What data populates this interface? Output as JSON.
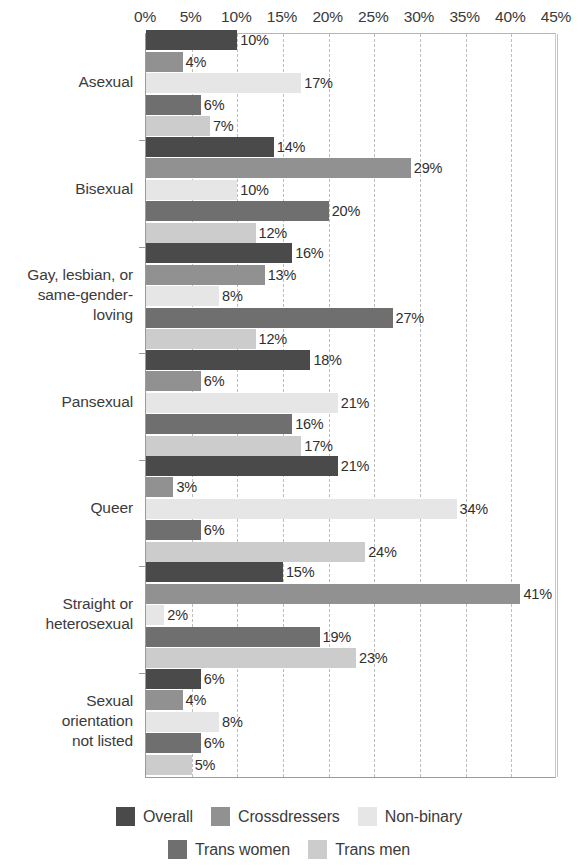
{
  "chart_data": {
    "type": "bar",
    "orientation": "horizontal",
    "title": "",
    "subtitle": "",
    "xlabel": "",
    "ylabel": "",
    "xlim": [
      0,
      45
    ],
    "xtick_labels": [
      "0%",
      "5%",
      "10%",
      "15%",
      "20%",
      "25%",
      "30%",
      "35%",
      "40%",
      "45%"
    ],
    "xticks": [
      0,
      5,
      10,
      15,
      20,
      25,
      30,
      35,
      40,
      45
    ],
    "grid": true,
    "grid_axis": "x",
    "legend_position": "bottom",
    "value_label_suffix": "%",
    "categories": [
      "Asexual",
      "Bisexual",
      "Gay, lesbian, or same-gender-loving",
      "Pansexual",
      "Queer",
      "Straight or heterosexual",
      "Sexual orientation not listed"
    ],
    "category_label_lines": [
      [
        "Asexual"
      ],
      [
        "Bisexual"
      ],
      [
        "Gay, lesbian, or",
        "same-gender-",
        "loving"
      ],
      [
        "Pansexual"
      ],
      [
        "Queer"
      ],
      [
        "Straight or",
        "heterosexual"
      ],
      [
        "Sexual",
        "orientation",
        "not listed"
      ]
    ],
    "series": [
      {
        "name": "Overall",
        "color": "#4a4a4a",
        "values": [
          10,
          14,
          16,
          18,
          21,
          15,
          6
        ]
      },
      {
        "name": "Crossdressers",
        "color": "#919191",
        "values": [
          4,
          29,
          13,
          6,
          3,
          41,
          4
        ]
      },
      {
        "name": "Non-binary",
        "color": "#e6e6e6",
        "values": [
          17,
          10,
          8,
          21,
          34,
          2,
          8
        ]
      },
      {
        "name": "Trans women",
        "color": "#6f6f6f",
        "values": [
          6,
          20,
          27,
          16,
          6,
          19,
          6
        ]
      },
      {
        "name": "Trans men",
        "color": "#cccccc",
        "values": [
          7,
          12,
          12,
          17,
          24,
          23,
          5
        ]
      }
    ],
    "value_labels": [
      [
        "10%",
        "4%",
        "17%",
        "6%",
        "7%"
      ],
      [
        "14%",
        "29%",
        "10%",
        "20%",
        "12%"
      ],
      [
        "16%",
        "13%",
        "8%",
        "27%",
        "12%"
      ],
      [
        "18%",
        "6%",
        "21%",
        "16%",
        "17%"
      ],
      [
        "21%",
        "3%",
        "34%",
        "6%",
        "24%"
      ],
      [
        "15%",
        "41%",
        "2%",
        "19%",
        "23%"
      ],
      [
        "6%",
        "4%",
        "8%",
        "6%",
        "5%"
      ]
    ]
  },
  "legend": {
    "rows": [
      [
        {
          "label": "Overall",
          "color": "#4a4a4a"
        },
        {
          "label": "Crossdressers",
          "color": "#919191"
        },
        {
          "label": "Non-binary",
          "color": "#e6e6e6"
        }
      ],
      [
        {
          "label": "Trans women",
          "color": "#6f6f6f"
        },
        {
          "label": "Trans men",
          "color": "#cccccc"
        }
      ]
    ]
  }
}
